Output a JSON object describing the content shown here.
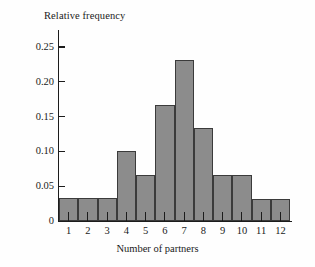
{
  "chart_data": {
    "type": "bar",
    "title": "",
    "xlabel": "Number of partners",
    "ylabel": "Relative frequency",
    "categories": [
      "1",
      "2",
      "3",
      "4",
      "5",
      "6",
      "7",
      "8",
      "9",
      "10",
      "11",
      "12"
    ],
    "values": [
      0.033,
      0.033,
      0.033,
      0.1,
      0.066,
      0.166,
      0.232,
      0.133,
      0.066,
      0.066,
      0.032,
      0.032
    ],
    "ylim": [
      0,
      0.26
    ],
    "yticks": [
      0,
      0.05,
      0.1,
      0.15,
      0.2,
      0.25
    ],
    "ytick_labels": [
      "0",
      "0.05",
      "0.10",
      "0.15",
      "0.20",
      "0.25"
    ],
    "grid": false,
    "legend": "none",
    "bar_fill_color": "#8c8c8c",
    "bar_edge_color": "#3b3b3b",
    "axis_color": "#1c1c1c",
    "background_color": "#fefefe"
  }
}
